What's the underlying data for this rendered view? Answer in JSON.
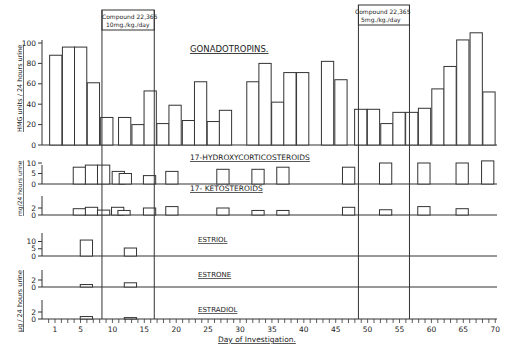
{
  "chart_data": [
    {
      "type": "bar",
      "title": "GONADOTROPINS.",
      "ylabel": "HMG units / 24 hours urine",
      "xlabel": "Day of Investigation.",
      "ylim": [
        0,
        110
      ],
      "yticks": [
        0,
        20,
        40,
        60,
        80,
        100
      ],
      "bars": [
        {
          "start_day": 0.1,
          "value": 88
        },
        {
          "start_day": 2.1,
          "value": 96
        },
        {
          "start_day": 4.0,
          "value": 96
        },
        {
          "start_day": 6.0,
          "value": 61
        },
        {
          "start_day": 8.1,
          "value": 27
        },
        {
          "start_day": 10.9,
          "value": 27
        },
        {
          "start_day": 13.0,
          "value": 20
        },
        {
          "start_day": 14.9,
          "value": 53
        },
        {
          "start_day": 16.9,
          "value": 21
        },
        {
          "start_day": 18.8,
          "value": 39
        },
        {
          "start_day": 20.9,
          "value": 24
        },
        {
          "start_day": 22.8,
          "value": 62
        },
        {
          "start_day": 24.8,
          "value": 23
        },
        {
          "start_day": 26.7,
          "value": 34
        },
        {
          "start_day": 31.0,
          "value": 62
        },
        {
          "start_day": 32.9,
          "value": 80
        },
        {
          "start_day": 34.9,
          "value": 42
        },
        {
          "start_day": 36.8,
          "value": 71
        },
        {
          "start_day": 38.8,
          "value": 71
        },
        {
          "start_day": 42.7,
          "value": 82
        },
        {
          "start_day": 44.8,
          "value": 64
        },
        {
          "start_day": 47.9,
          "value": 35
        },
        {
          "start_day": 49.9,
          "value": 35
        },
        {
          "start_day": 52.0,
          "value": 21
        },
        {
          "start_day": 53.9,
          "value": 32
        },
        {
          "start_day": 55.9,
          "value": 32
        },
        {
          "start_day": 57.9,
          "value": 36
        },
        {
          "start_day": 60.0,
          "value": 55
        },
        {
          "start_day": 61.9,
          "value": 77
        },
        {
          "start_day": 63.9,
          "value": 103
        },
        {
          "start_day": 66.0,
          "value": 110
        },
        {
          "start_day": 68.0,
          "value": 52
        }
      ]
    },
    {
      "type": "bar",
      "title": "17-HYDROXYCORTICOSTEROIDS",
      "ylabel": "mg/24 hours urine",
      "yticks": [
        0,
        5,
        10
      ],
      "bars": [
        {
          "start_day": 3.8,
          "value": 8
        },
        {
          "start_day": 5.7,
          "value": 9
        },
        {
          "start_day": 7.6,
          "value": 9
        },
        {
          "start_day": 9.9,
          "value": 6
        },
        {
          "start_day": 11.0,
          "value": 5
        },
        {
          "start_day": 14.8,
          "value": 4
        },
        {
          "start_day": 18.3,
          "value": 6
        },
        {
          "start_day": 26.3,
          "value": 7
        },
        {
          "start_day": 31.8,
          "value": 7
        },
        {
          "start_day": 35.7,
          "value": 8
        },
        {
          "start_day": 46.0,
          "value": 8
        },
        {
          "start_day": 51.8,
          "value": 10
        },
        {
          "start_day": 57.8,
          "value": 10
        },
        {
          "start_day": 63.8,
          "value": 10
        },
        {
          "start_day": 67.8,
          "value": 11
        }
      ]
    },
    {
      "type": "bar",
      "title": "17- KETOSTEROIDS",
      "ylabel": "mg/24 hours urine",
      "yticks": [
        0,
        2
      ],
      "bars": [
        {
          "start_day": 3.8,
          "value": 1.8
        },
        {
          "start_day": 5.7,
          "value": 2.2
        },
        {
          "start_day": 7.6,
          "value": 1.4
        },
        {
          "start_day": 9.8,
          "value": 2.2
        },
        {
          "start_day": 10.8,
          "value": 1.3
        },
        {
          "start_day": 14.8,
          "value": 2.0
        },
        {
          "start_day": 18.3,
          "value": 2.4
        },
        {
          "start_day": 26.3,
          "value": 2.0
        },
        {
          "start_day": 31.8,
          "value": 1.3
        },
        {
          "start_day": 35.7,
          "value": 1.3
        },
        {
          "start_day": 46.0,
          "value": 2.2
        },
        {
          "start_day": 51.8,
          "value": 1.5
        },
        {
          "start_day": 57.8,
          "value": 2.4
        },
        {
          "start_day": 63.8,
          "value": 1.8
        }
      ]
    },
    {
      "type": "bar",
      "title": "ESTRIOL",
      "ylabel": "µg / 24 hours urine",
      "yticks": [
        0,
        5,
        10
      ],
      "bars": [
        {
          "start_day": 4.9,
          "value": 11
        },
        {
          "start_day": 11.8,
          "value": 5.5
        }
      ]
    },
    {
      "type": "bar",
      "title": "ESTRONE",
      "ylabel": "µg / 24 hours urine",
      "yticks": [
        0,
        2
      ],
      "bars": [
        {
          "start_day": 4.9,
          "value": 0.7
        },
        {
          "start_day": 11.8,
          "value": 1.2
        }
      ]
    },
    {
      "type": "bar",
      "title": "ESTRADIOL",
      "ylabel": "µg / 24 hours urine",
      "yticks": [
        0,
        2
      ],
      "bars": [
        {
          "start_day": 4.9,
          "value": 0.7
        },
        {
          "start_day": 11.8,
          "value": 0.4
        }
      ]
    }
  ],
  "treatments": [
    {
      "label_line1": "Compound 22,365",
      "label_line2": "10mg./kg./day",
      "start_day": 8.3,
      "end_day": 16.5
    },
    {
      "label_line1": "Compound 22,365",
      "label_line2": "5mg./kg./day",
      "start_day": 48.5,
      "end_day": 56.5
    }
  ],
  "x_axis": {
    "label": "Day of Investigation.",
    "ticks": [
      1,
      5,
      10,
      15,
      20,
      25,
      30,
      35,
      40,
      45,
      50,
      55,
      60,
      65,
      70
    ]
  },
  "labels": {
    "gonadotropins": "GONADOTROPINS.",
    "hydroxy": "17-HYDROXYCORTICOSTEROIDS",
    "keto": "17- KETOSTEROIDS",
    "estriol": "ESTRIOL",
    "estrone": "ESTRONE",
    "estradiol": "ESTRADIOL",
    "ylabel_hmg": "HMG units / 24 hours urine",
    "ylabel_mg": "mg/24 hours urine",
    "ylabel_ug": "µg / 24 hours urine"
  }
}
